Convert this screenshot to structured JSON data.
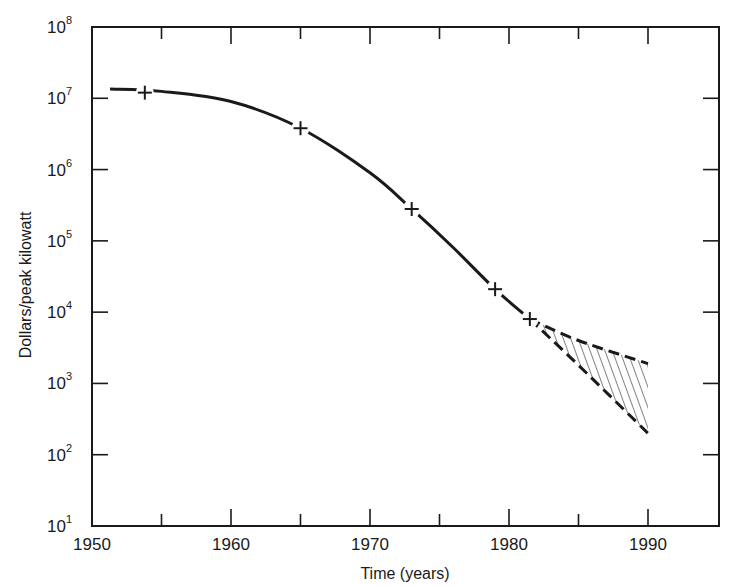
{
  "chart_data": {
    "type": "line",
    "title": "",
    "xlabel": "Time (years)",
    "ylabel": "Dollars/peak kilowatt",
    "yscale": "log",
    "xlim": [
      1950,
      1995
    ],
    "ylim": [
      10,
      100000000
    ],
    "x_ticks": [
      1950,
      1960,
      1970,
      1980,
      1990
    ],
    "x_tick_labels": [
      "1950",
      "1960",
      "1970",
      "1980",
      "1990"
    ],
    "x_minor_ticks": [
      1955,
      1965,
      1975,
      1985
    ],
    "y_ticks_exponents": [
      1,
      2,
      3,
      4,
      5,
      6,
      7,
      8
    ],
    "y_tick_labels": [
      {
        "base": "10",
        "exp": "1"
      },
      {
        "base": "10",
        "exp": "2"
      },
      {
        "base": "10",
        "exp": "3"
      },
      {
        "base": "10",
        "exp": "4"
      },
      {
        "base": "10",
        "exp": "5"
      },
      {
        "base": "10",
        "exp": "6"
      },
      {
        "base": "10",
        "exp": "7"
      },
      {
        "base": "10",
        "exp": "8"
      }
    ],
    "grid": false,
    "legend": null,
    "series": [
      {
        "name": "Historical cost (solid curve)",
        "style": "solid",
        "points": [
          {
            "x": 1951.3,
            "y": 13500000
          },
          {
            "x": 1955,
            "y": 12500000
          },
          {
            "x": 1960,
            "y": 9000000
          },
          {
            "x": 1965,
            "y": 3800000
          },
          {
            "x": 1970,
            "y": 900000
          },
          {
            "x": 1973,
            "y": 280000
          },
          {
            "x": 1976,
            "y": 80000
          },
          {
            "x": 1979,
            "y": 21000
          },
          {
            "x": 1981.5,
            "y": 8000
          }
        ]
      },
      {
        "name": "Data points (crosses)",
        "style": "marker-plus",
        "points": [
          {
            "x": 1953.8,
            "y": 12000000
          },
          {
            "x": 1965,
            "y": 3800000
          },
          {
            "x": 1973,
            "y": 280000
          },
          {
            "x": 1979,
            "y": 21000
          },
          {
            "x": 1981.5,
            "y": 8000
          }
        ]
      },
      {
        "name": "Projection upper bound (dashed)",
        "style": "dashed",
        "points": [
          {
            "x": 1981.5,
            "y": 8000
          },
          {
            "x": 1985,
            "y": 4000
          },
          {
            "x": 1990,
            "y": 1900
          }
        ]
      },
      {
        "name": "Projection lower bound (dashed)",
        "style": "dashed",
        "points": [
          {
            "x": 1981.5,
            "y": 8000
          },
          {
            "x": 1985,
            "y": 1800
          },
          {
            "x": 1990,
            "y": 200
          }
        ]
      }
    ],
    "annotations": [
      {
        "type": "hatched-region",
        "between": [
          "Projection upper bound (dashed)",
          "Projection lower bound (dashed)"
        ],
        "x_range": [
          1982,
          1990
        ]
      }
    ]
  }
}
